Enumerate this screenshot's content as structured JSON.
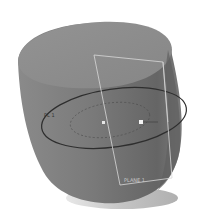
{
  "scene": {
    "type": "3d-cad-model-view",
    "object": "rounded cylinder body",
    "colors": {
      "background": "#ffffff",
      "body": "#7d7d7d",
      "top_face": "#8e8e8e",
      "shadow_side": "#5e5e5e",
      "base_ring": "#cfcfcf",
      "sketch_line": "#2e2e2e",
      "plane_edge": "#d8d8d8"
    },
    "labels": {
      "sketch_label": "PL 1",
      "plane_label": "PLANE 1"
    },
    "points": [
      {
        "name": "center-point"
      },
      {
        "name": "radius-point"
      }
    ]
  }
}
